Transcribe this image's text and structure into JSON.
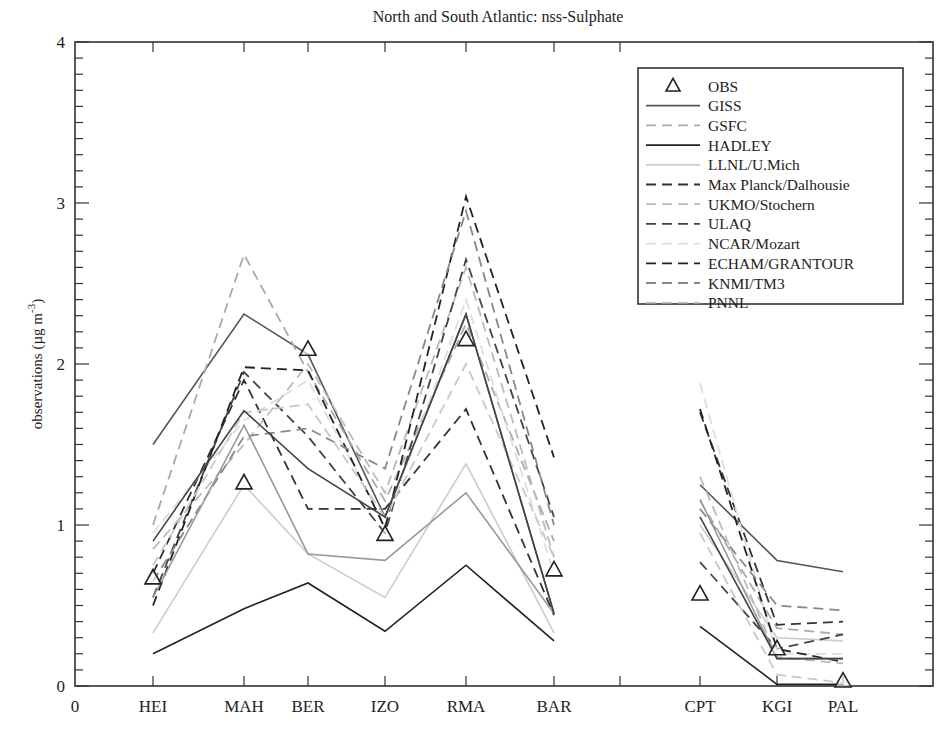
{
  "chart_data": {
    "type": "line",
    "title": "North and South Atlantic: nss-Sulphate",
    "xlabel": "",
    "ylabel": "observations (µg m⁻³)",
    "ylabel_main": "observations (µg m",
    "ylabel_sup": "-3",
    "ylabel_close": ")",
    "ylim": [
      0,
      4
    ],
    "yticks": [
      0,
      1,
      2,
      3,
      4
    ],
    "yminor_step": 0.1,
    "x_origin_label": "0",
    "categories": [
      "HEI",
      "MAH",
      "BER",
      "IZO",
      "RMA",
      "BAR",
      "",
      "CPT",
      "KGI",
      "PAL"
    ],
    "north_atlantic_stations": [
      "HEI",
      "MAH",
      "BER",
      "IZO",
      "RMA",
      "BAR"
    ],
    "south_atlantic_stations": [
      "CPT",
      "KGI",
      "PAL"
    ],
    "grid": false,
    "legend_position": "upper right",
    "observations": {
      "name": "OBS",
      "marker": "triangle",
      "values": [
        0.67,
        1.26,
        2.09,
        0.94,
        2.15,
        0.72,
        null,
        0.57,
        0.23,
        0.03
      ]
    },
    "series": [
      {
        "name": "GISS",
        "style": "solid",
        "color": "#555555",
        "values": [
          1.5,
          2.31,
          2.06,
          1.05,
          2.31,
          0.45,
          null,
          1.25,
          0.78,
          0.71
        ]
      },
      {
        "name": "GSFC",
        "style": "dashed",
        "color": "#aaaaaa",
        "values": [
          1.0,
          2.68,
          1.95,
          1.15,
          2.25,
          0.9,
          null,
          1.15,
          0.36,
          0.32
        ]
      },
      {
        "name": "HADLEY",
        "style": "solid",
        "color": "#222222",
        "values": [
          0.2,
          0.48,
          0.64,
          0.34,
          0.75,
          0.28,
          null,
          0.37,
          0.01,
          0.01
        ]
      },
      {
        "name": "LLNL/U.Mich",
        "style": "solid",
        "color": "#cccccc",
        "values": [
          0.33,
          1.25,
          0.82,
          0.55,
          1.38,
          0.33,
          null,
          1.0,
          0.3,
          0.28
        ]
      },
      {
        "name": "Max Planck/Dalhousie",
        "style": "dashed",
        "color": "#333333",
        "values": [
          0.7,
          1.9,
          1.1,
          1.1,
          1.72,
          0.44,
          null,
          1.7,
          0.38,
          0.4
        ]
      },
      {
        "name": "UKMO/Stochern",
        "style": "dashed",
        "color": "#bbbbbb",
        "values": [
          0.85,
          1.5,
          2.0,
          1.2,
          2.6,
          0.8,
          null,
          1.3,
          0.18,
          0.14
        ]
      },
      {
        "name": "ULAQ",
        "style": "dashed",
        "color": "#444444",
        "values": [
          0.55,
          1.95,
          1.55,
          0.95,
          2.65,
          1.05,
          null,
          0.77,
          0.23,
          0.32
        ]
      },
      {
        "name": "NCAR/Mozart",
        "style": "dashed",
        "color": "#dddddd",
        "values": [
          0.95,
          1.65,
          1.9,
          1.0,
          2.4,
          0.7,
          null,
          1.88,
          0.2,
          0.2
        ]
      },
      {
        "name": "ECHAM/GRANTOUR",
        "style": "dashed",
        "color": "#222222",
        "values": [
          0.5,
          1.98,
          1.96,
          0.98,
          3.04,
          1.42,
          null,
          1.72,
          0.23,
          0.15
        ]
      },
      {
        "name": "KNMI/TM3",
        "style": "dashed",
        "color": "#888888",
        "values": [
          0.65,
          1.55,
          1.6,
          1.35,
          2.95,
          1.0,
          null,
          1.1,
          0.5,
          0.47
        ]
      },
      {
        "name": "PNNL",
        "style": "dashed",
        "color": "#c8c8c8",
        "values": [
          0.75,
          1.7,
          1.75,
          1.05,
          2.0,
          0.8,
          null,
          0.95,
          0.07,
          0.02
        ]
      },
      {
        "name": "MAH-model-solid-grey",
        "style": "solid",
        "color": "#999999",
        "legend": false,
        "values": [
          0.55,
          1.62,
          0.82,
          0.78,
          1.2,
          0.45,
          null,
          1.16,
          0.17,
          0.17
        ]
      },
      {
        "name": "MAH-model-solid-mid",
        "style": "solid",
        "color": "#444444",
        "legend": false,
        "values": [
          0.9,
          1.71,
          1.35,
          1.05,
          2.31,
          0.45,
          null,
          1.05,
          0.17,
          0.17
        ]
      }
    ]
  },
  "legend": {
    "items": [
      {
        "label": "OBS",
        "kind": "marker"
      },
      {
        "label": "GISS",
        "kind": "solid",
        "color": "#555555"
      },
      {
        "label": "GSFC",
        "kind": "dashed",
        "color": "#aaaaaa"
      },
      {
        "label": "HADLEY",
        "kind": "solid",
        "color": "#222222"
      },
      {
        "label": "LLNL/U.Mich",
        "kind": "solid",
        "color": "#cccccc"
      },
      {
        "label": "Max Planck/Dalhousie",
        "kind": "dashed",
        "color": "#333333"
      },
      {
        "label": "UKMO/Stochern",
        "kind": "dashed",
        "color": "#bbbbbb"
      },
      {
        "label": "ULAQ",
        "kind": "dashed",
        "color": "#444444"
      },
      {
        "label": "NCAR/Mozart",
        "kind": "dashed",
        "color": "#dddddd"
      },
      {
        "label": "ECHAM/GRANTOUR",
        "kind": "dashed",
        "color": "#222222"
      },
      {
        "label": "KNMI/TM3",
        "kind": "dashed",
        "color": "#888888"
      },
      {
        "label": "PNNL",
        "kind": "dashed",
        "color": "#c8c8c8"
      }
    ]
  }
}
